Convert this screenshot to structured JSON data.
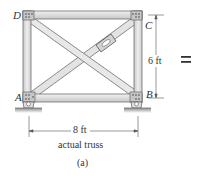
{
  "figure": {
    "title": "actual truss",
    "caption": "(a)",
    "joints": {
      "A": "A",
      "B": "B",
      "C": "C",
      "D": "D"
    },
    "dimensions": {
      "height": "6 ft",
      "width": "8 ft"
    },
    "equals_sign": "="
  },
  "colors": {
    "member_fill": "#e6e6e6",
    "member_edge": "#6f6f6f",
    "gusset": "#bdbdbd",
    "ground": "#9a9a9a",
    "text": "#333333"
  }
}
